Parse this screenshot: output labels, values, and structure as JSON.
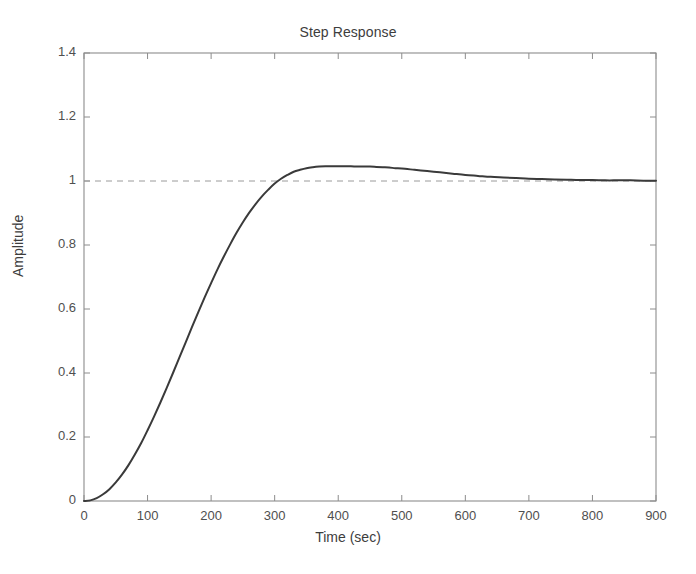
{
  "figure": {
    "title": "Step Response",
    "background_color": "#ffffff",
    "axes_color": "#8c8c8c",
    "curve_color": "#3a3a3a",
    "reference_line_color": "#9a9a9a"
  },
  "chart_data": {
    "type": "line",
    "title": "Step Response",
    "xlabel": "Time (sec)",
    "ylabel": "Amplitude",
    "xlim": [
      0,
      900
    ],
    "ylim": [
      0,
      1.4
    ],
    "xticks": [
      0,
      100,
      200,
      300,
      400,
      500,
      600,
      700,
      800,
      900
    ],
    "xtick_labels": [
      "0",
      "100",
      "200",
      "300",
      "400",
      "500",
      "600",
      "700",
      "800",
      "900"
    ],
    "yticks": [
      0,
      0.2,
      0.4,
      0.6,
      0.8,
      1,
      1.2,
      1.4
    ],
    "ytick_labels": [
      "0",
      "0.2",
      "0.4",
      "0.6",
      "0.8",
      "1",
      "1.2",
      "1.4"
    ],
    "grid": false,
    "legend": null,
    "reference_lines": [
      {
        "orientation": "horizontal",
        "value": 1,
        "style": "dashed",
        "label": "steady-state = 1"
      }
    ],
    "annotations": {
      "peak_value": 1.04,
      "peak_time": 450,
      "steady_state": 1.0,
      "overshoot_percent": 4,
      "rise_time_approx": 250,
      "settling_time_approx": 700
    },
    "series": [
      {
        "name": "step response",
        "color": "#3a3a3a",
        "line_width": 2,
        "x": [
          0,
          10,
          20,
          30,
          40,
          50,
          60,
          70,
          80,
          90,
          100,
          110,
          120,
          130,
          140,
          150,
          160,
          170,
          180,
          190,
          200,
          210,
          220,
          230,
          240,
          250,
          260,
          270,
          280,
          290,
          300,
          310,
          320,
          330,
          340,
          350,
          360,
          370,
          380,
          390,
          400,
          410,
          420,
          430,
          440,
          450,
          460,
          470,
          480,
          490,
          500,
          520,
          540,
          560,
          580,
          600,
          620,
          640,
          660,
          680,
          700,
          720,
          740,
          760,
          780,
          800,
          820,
          840,
          860,
          880,
          900
        ],
        "y": [
          0,
          0.002,
          0.009,
          0.021,
          0.037,
          0.058,
          0.083,
          0.112,
          0.145,
          0.181,
          0.221,
          0.263,
          0.307,
          0.353,
          0.4,
          0.448,
          0.496,
          0.544,
          0.591,
          0.637,
          0.681,
          0.724,
          0.764,
          0.802,
          0.838,
          0.871,
          0.901,
          0.928,
          0.952,
          0.973,
          0.992,
          1.007,
          1.019,
          1.029,
          1.035,
          1.04,
          1.043,
          1.045,
          1.046,
          1.046,
          1.046,
          1.046,
          1.046,
          1.045,
          1.045,
          1.045,
          1.044,
          1.043,
          1.042,
          1.04,
          1.039,
          1.035,
          1.031,
          1.027,
          1.023,
          1.019,
          1.016,
          1.013,
          1.011,
          1.009,
          1.007,
          1.006,
          1.005,
          1.004,
          1.003,
          1.003,
          1.002,
          1.002,
          1.002,
          1.001,
          1.001
        ]
      }
    ]
  }
}
